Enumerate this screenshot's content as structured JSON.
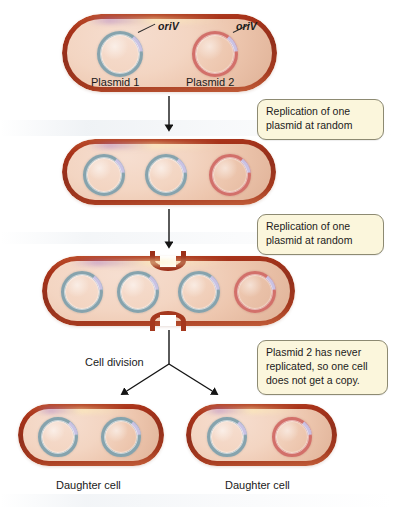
{
  "figure": {
    "colors": {
      "cell_wall": "#a5341b",
      "cytoplasm": "#f0cdb5",
      "plasmid_blue": "#86a3ad",
      "plasmid_red": "#d2706a",
      "oriv_highlight": "#c9c2e4",
      "callout_fill": "#fbf6dc",
      "callout_border": "#8d8a72",
      "arrow": "#1a1a1a",
      "background": "#ffffff"
    }
  },
  "stages": [
    {
      "id": "stage-1-parent-cell",
      "plasmids": [
        {
          "id": "plasmid-1",
          "color": "blue",
          "label": "Plasmid 1",
          "oriv_label": "oriV",
          "has_oriv_label": true
        },
        {
          "id": "plasmid-2",
          "color": "red",
          "label": "Plasmid 2",
          "oriv_label": "oriV",
          "has_oriv_label": true
        }
      ],
      "plasmid_count": 2,
      "blue_count": 1,
      "red_count": 1,
      "dividing": false
    },
    {
      "id": "stage-2-one-replication",
      "plasmids": [
        {
          "id": "plasmid-1a",
          "color": "blue"
        },
        {
          "id": "plasmid-1b",
          "color": "blue"
        },
        {
          "id": "plasmid-2",
          "color": "red"
        }
      ],
      "plasmid_count": 3,
      "blue_count": 2,
      "red_count": 1,
      "dividing": false
    },
    {
      "id": "stage-3-two-replications",
      "plasmids": [
        {
          "id": "plasmid-1a",
          "color": "blue"
        },
        {
          "id": "plasmid-1b",
          "color": "blue"
        },
        {
          "id": "plasmid-1c",
          "color": "blue"
        },
        {
          "id": "plasmid-2",
          "color": "red"
        }
      ],
      "plasmid_count": 4,
      "blue_count": 3,
      "red_count": 1,
      "dividing": true
    },
    {
      "id": "daughter-cell-left",
      "label": "Daughter cell",
      "plasmids": [
        {
          "id": "plasmid-1a",
          "color": "blue"
        },
        {
          "id": "plasmid-1b",
          "color": "blue"
        }
      ],
      "plasmid_count": 2,
      "blue_count": 2,
      "red_count": 0,
      "dividing": false
    },
    {
      "id": "daughter-cell-right",
      "label": "Daughter cell",
      "plasmids": [
        {
          "id": "plasmid-1c",
          "color": "blue"
        },
        {
          "id": "plasmid-2",
          "color": "red"
        }
      ],
      "plasmid_count": 2,
      "blue_count": 1,
      "red_count": 1,
      "dividing": false
    }
  ],
  "labels": {
    "plasmid_1": "Plasmid 1",
    "plasmid_2": "Plasmid 2",
    "oriv_1": "oriV",
    "oriv_2": "oriV",
    "cell_division": "Cell division",
    "daughter_cell_left": "Daughter cell",
    "daughter_cell_right": "Daughter cell"
  },
  "callouts": [
    {
      "id": "callout-replication-1",
      "lines": [
        "Replication of one",
        "plasmid at random"
      ]
    },
    {
      "id": "callout-replication-2",
      "lines": [
        "Replication of one",
        "plasmid at random"
      ]
    },
    {
      "id": "callout-no-copy",
      "lines": [
        "Plasmid 2 has never",
        "replicated, so one cell",
        "does not get a copy."
      ]
    }
  ]
}
